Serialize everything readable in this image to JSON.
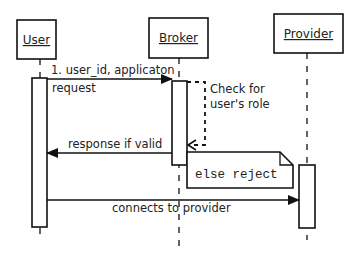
{
  "diagram": {
    "type": "uml-sequence",
    "participants": [
      {
        "name": "User",
        "x": 40
      },
      {
        "name": "Broker",
        "x": 179
      },
      {
        "name": "Provider",
        "x": 307
      }
    ],
    "messages": [
      {
        "from": "User",
        "to": "Broker",
        "label_line1": "1. user_id, applicaton",
        "label_line2": "request",
        "style": "solid",
        "arrow": "filled"
      },
      {
        "from": "Broker",
        "to": "Broker",
        "label_line1": "Check for",
        "label_line2": "user's role",
        "style": "dashed",
        "arrow": "open",
        "kind": "self-call"
      },
      {
        "from": "Broker",
        "to": "User",
        "label": "response if valid",
        "style": "solid",
        "arrow": "filled"
      },
      {
        "from": "User",
        "to": "Provider",
        "label": "connects to provider",
        "style": "solid",
        "arrow": "filled"
      }
    ],
    "note": {
      "text": "else reject",
      "attached_to": "Broker"
    },
    "colors": {
      "stroke": "#111111",
      "text": "#222222",
      "background": "#ffffff"
    }
  }
}
